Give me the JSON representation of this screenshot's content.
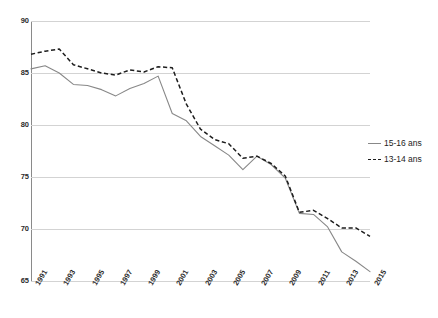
{
  "chart_data": {
    "type": "line",
    "title": "",
    "subtitle": "",
    "xlabel": "",
    "ylabel": "",
    "ylim": [
      65,
      90
    ],
    "yticks": [
      65,
      70,
      75,
      80,
      85,
      90
    ],
    "grid": true,
    "legend_position": "right",
    "x": [
      1991,
      1992,
      1993,
      1994,
      1995,
      1996,
      1997,
      1998,
      1999,
      2000,
      2001,
      2002,
      2003,
      2004,
      2005,
      2006,
      2007,
      2008,
      2009,
      2010,
      2011,
      2012,
      2013,
      2014,
      2015
    ],
    "xtick_labels": [
      "1991",
      "1993",
      "1995",
      "1997",
      "1999",
      "2001",
      "2003",
      "2005",
      "2007",
      "2009",
      "2011",
      "2013",
      "2015"
    ],
    "xticks": [
      1991,
      1993,
      1995,
      1997,
      1999,
      2001,
      2003,
      2005,
      2007,
      2009,
      2011,
      2013,
      2015
    ],
    "series": [
      {
        "name": "15-16 ans",
        "style": "solid",
        "color": "#888888",
        "values": [
          85.4,
          85.7,
          85.0,
          83.9,
          83.8,
          83.4,
          82.8,
          83.5,
          84.0,
          84.7,
          81.1,
          80.4,
          78.9,
          78.0,
          77.1,
          75.7,
          77.0,
          76.2,
          74.9,
          71.5,
          71.4,
          70.2,
          67.8,
          66.9,
          65.9
        ]
      },
      {
        "name": "13-14 ans",
        "style": "dashed",
        "color": "#1d1d1d",
        "values": [
          86.8,
          87.1,
          87.3,
          85.8,
          85.4,
          85.0,
          84.8,
          85.3,
          85.1,
          85.6,
          85.5,
          82.0,
          79.6,
          78.6,
          78.2,
          76.8,
          77.0,
          76.3,
          75.1,
          71.6,
          71.8,
          71.0,
          70.1,
          70.1,
          69.3
        ]
      }
    ]
  },
  "legend": {
    "items": [
      {
        "label": "15-16 ans",
        "style": "solid"
      },
      {
        "label": "13-14 ans",
        "style": "dashed"
      }
    ]
  }
}
